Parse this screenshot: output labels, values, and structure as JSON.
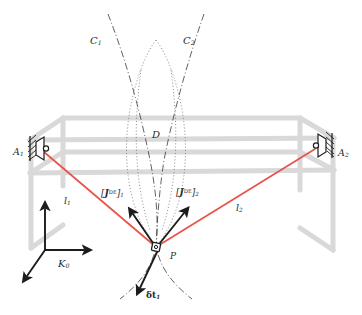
{
  "figure": {
    "type": "technical-diagram",
    "background_color": "#ffffff"
  },
  "colors": {
    "ray": "#e8534a",
    "frame": "#d9d9d9",
    "ink": "#1c1c1c",
    "label": "#2b2b2b",
    "curve": "#3a3a3a"
  },
  "labels": {
    "curve_c1": "C",
    "curve_c1_sub": "1",
    "curve_c2": "C",
    "curve_c2_sub": "2",
    "region_d": "D",
    "transducer_a1": "A",
    "transducer_a1_sub": "1",
    "transducer_a2": "A",
    "transducer_a2_sub": "2",
    "ray_l1": "l",
    "ray_l1_sub": "1",
    "ray_l2": "l",
    "ray_l2_sub": "2",
    "point_p": "P",
    "frame_k0": "K",
    "frame_k0_sub": "0",
    "vector_j1_open": "[",
    "vector_j1_sym": "J",
    "vector_j1_sup": "DE",
    "vector_j1_close": "]",
    "vector_j1_sub": "1",
    "vector_j2_open": "[",
    "vector_j2_sym": "J",
    "vector_j2_sup": "DE",
    "vector_j2_close": "]",
    "vector_j2_sub": "2",
    "delta_t1_sym": "δt",
    "delta_t1_sub": "1"
  },
  "geometry": {
    "point_p": {
      "x": 156,
      "y": 247
    },
    "transducer_a1": {
      "x": 41,
      "y": 151
    },
    "transducer_a2": {
      "x": 318,
      "y": 148
    },
    "ray_l1_label_pos": {
      "x": 68,
      "y": 199
    },
    "ray_l2_label_pos": {
      "x": 238,
      "y": 205
    },
    "vector_j1_tip": {
      "x": 133,
      "y": 212
    },
    "vector_j2_tip": {
      "x": 185,
      "y": 210
    },
    "delta_t1_tip": {
      "x": 140,
      "y": 285
    }
  }
}
